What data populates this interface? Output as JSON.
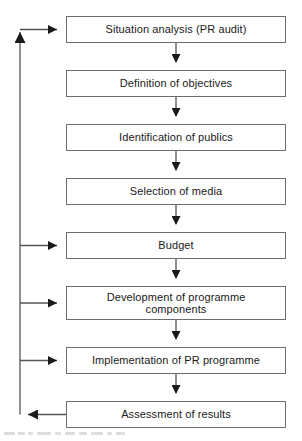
{
  "diagram": {
    "type": "flowchart",
    "orientation": "top-to-bottom",
    "colors": {
      "box_border": "#6d6d6d",
      "box_fill": "#ffffff",
      "connector": "#555555",
      "arrowhead": "#1a1a1a",
      "text": "#1a1a1a",
      "background": "#ffffff"
    },
    "nodes": [
      {
        "id": "situation-analysis",
        "label": "Situation analysis (PR audit)",
        "x": 66,
        "y": 16,
        "width": 220,
        "height": 27
      },
      {
        "id": "definition-of-objectives",
        "label": "Definition of objectives",
        "x": 66,
        "y": 70,
        "width": 220,
        "height": 27
      },
      {
        "id": "identification-of-publics",
        "label": "Identification of publics",
        "x": 66,
        "y": 124,
        "width": 220,
        "height": 27
      },
      {
        "id": "selection-of-media",
        "label": "Selection of media",
        "x": 66,
        "y": 178,
        "width": 220,
        "height": 27
      },
      {
        "id": "budget",
        "label": "Budget",
        "x": 66,
        "y": 232,
        "width": 220,
        "height": 27
      },
      {
        "id": "development-of-programme-components",
        "label": "Development of programme\ncomponents",
        "x": 66,
        "y": 286,
        "width": 220,
        "height": 34
      },
      {
        "id": "implementation-of-pr-programme",
        "label": "Implementation of PR programme",
        "x": 66,
        "y": 347,
        "width": 220,
        "height": 27
      },
      {
        "id": "assessment-of-results",
        "label": "Assessment of results",
        "x": 66,
        "y": 401,
        "width": 220,
        "height": 27
      }
    ],
    "connectors": [
      {
        "id": "situation-to-definition",
        "from": "situation-analysis",
        "to": "definition-of-objectives",
        "kind": "down-arrow"
      },
      {
        "id": "definition-to-identification",
        "from": "definition-of-objectives",
        "to": "identification-of-publics",
        "kind": "down-arrow"
      },
      {
        "id": "identification-to-selection",
        "from": "identification-of-publics",
        "to": "selection-of-media",
        "kind": "down-arrow"
      },
      {
        "id": "selection-to-budget",
        "from": "selection-of-media",
        "to": "budget",
        "kind": "down-arrow"
      },
      {
        "id": "budget-to-development",
        "from": "budget",
        "to": "development-of-programme-components",
        "kind": "down-arrow"
      },
      {
        "id": "development-to-implementation",
        "from": "development-of-programme-components",
        "to": "implementation-of-pr-programme",
        "kind": "down-arrow"
      },
      {
        "id": "implementation-to-assessment",
        "from": "implementation-of-pr-programme",
        "to": "assessment-of-results",
        "kind": "down-arrow"
      },
      {
        "id": "assessment-feedback-spine",
        "from": "assessment-of-results",
        "to": "feedback-spine",
        "kind": "feedback-left"
      },
      {
        "id": "feedback-to-situation-analysis",
        "from": "feedback-spine",
        "to": "situation-analysis",
        "kind": "feedback-right-arrow"
      },
      {
        "id": "feedback-to-budget",
        "from": "feedback-spine",
        "to": "budget",
        "kind": "feedback-right-arrow"
      },
      {
        "id": "feedback-to-development",
        "from": "feedback-spine",
        "to": "development-of-programme-components",
        "kind": "feedback-right-arrow"
      },
      {
        "id": "feedback-to-implementation",
        "from": "feedback-spine",
        "to": "implementation-of-pr-programme",
        "kind": "feedback-right-arrow"
      }
    ]
  }
}
